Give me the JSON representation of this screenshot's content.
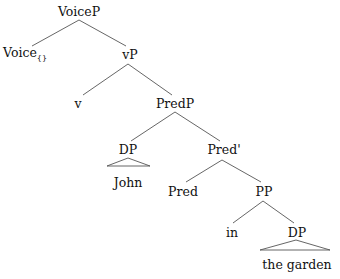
{
  "tree": {
    "title": "Syntax tree",
    "nodes": [
      {
        "id": "voicep",
        "label": "VoiceP",
        "x": 79,
        "y": 12
      },
      {
        "id": "voice",
        "label": "Voice",
        "sub": "{}",
        "x": 25,
        "y": 55
      },
      {
        "id": "vp",
        "label": "vP",
        "x": 130,
        "y": 55
      },
      {
        "id": "v",
        "label": "v",
        "x": 78,
        "y": 104
      },
      {
        "id": "predp",
        "label": "PredP",
        "x": 175,
        "y": 104
      },
      {
        "id": "dp1",
        "label": "DP",
        "x": 128,
        "y": 150
      },
      {
        "id": "john",
        "label": "John",
        "x": 128,
        "y": 183
      },
      {
        "id": "predbar",
        "label": "Pred'",
        "x": 224,
        "y": 150
      },
      {
        "id": "pred",
        "label": "Pred",
        "x": 183,
        "y": 192
      },
      {
        "id": "pp",
        "label": "PP",
        "x": 264,
        "y": 192
      },
      {
        "id": "in",
        "label": "in",
        "x": 232,
        "y": 233
      },
      {
        "id": "dp2",
        "label": "DP",
        "x": 297,
        "y": 233
      },
      {
        "id": "garden",
        "label": "the garden",
        "x": 297,
        "y": 265
      }
    ],
    "edges": [
      {
        "from": "voicep",
        "to": "voice",
        "x1": 79,
        "y1": 20,
        "x2": 32,
        "y2": 46
      },
      {
        "from": "voicep",
        "to": "vp",
        "x1": 79,
        "y1": 20,
        "x2": 126,
        "y2": 46
      },
      {
        "from": "vp",
        "to": "v",
        "x1": 128,
        "y1": 64,
        "x2": 83,
        "y2": 95
      },
      {
        "from": "vp",
        "to": "predp",
        "x1": 128,
        "y1": 64,
        "x2": 172,
        "y2": 95
      },
      {
        "from": "predp",
        "to": "dp1",
        "x1": 175,
        "y1": 112,
        "x2": 131,
        "y2": 141
      },
      {
        "from": "predp",
        "to": "predbar",
        "x1": 175,
        "y1": 112,
        "x2": 220,
        "y2": 141
      },
      {
        "from": "predbar",
        "to": "pred",
        "x1": 222,
        "y1": 160,
        "x2": 186,
        "y2": 182
      },
      {
        "from": "predbar",
        "to": "pp",
        "x1": 222,
        "y1": 160,
        "x2": 261,
        "y2": 182
      },
      {
        "from": "pp",
        "to": "in",
        "x1": 263,
        "y1": 201,
        "x2": 233,
        "y2": 223
      },
      {
        "from": "pp",
        "to": "dp2",
        "x1": 263,
        "y1": 201,
        "x2": 294,
        "y2": 223
      }
    ],
    "triangles": [
      {
        "under": "dp1",
        "apex": [
          128,
          158
        ],
        "left": [
          107,
          166
        ],
        "right": [
          150,
          166
        ]
      },
      {
        "under": "dp2",
        "apex": [
          296,
          240
        ],
        "left": [
          260,
          250
        ],
        "right": [
          330,
          250
        ]
      }
    ],
    "line_color": "#555555"
  }
}
